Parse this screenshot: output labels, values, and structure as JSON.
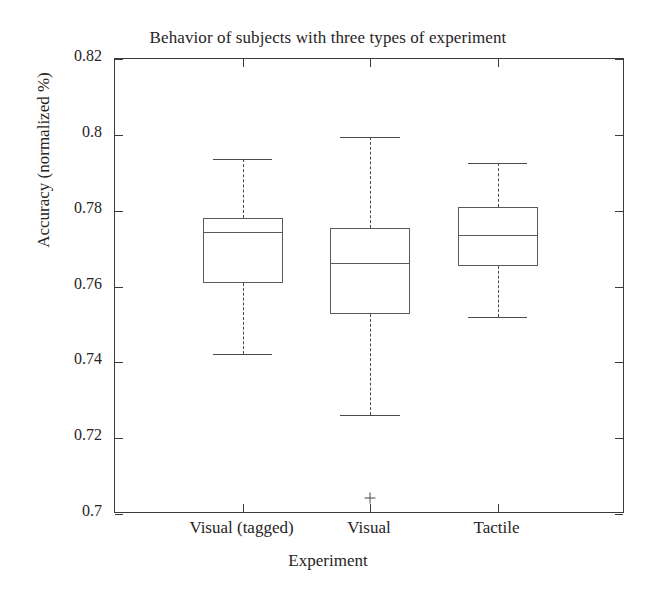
{
  "chart_data": {
    "type": "box",
    "title": "Behavior of subjects with three types of experiment",
    "xlabel": "Experiment",
    "ylabel": "Accuracy (normalized %)",
    "categories": [
      "Visual (tagged)",
      "Visual",
      "Tactile"
    ],
    "ylim": [
      0.7,
      0.82
    ],
    "yticks": [
      0.7,
      0.72,
      0.74,
      0.76,
      0.78,
      0.8,
      0.82
    ],
    "ytick_labels": [
      "0.7",
      "0.72",
      "0.74",
      "0.76",
      "0.78",
      "0.8",
      "0.82"
    ],
    "grid": false,
    "legend": "none",
    "box_color": "#5a5a5a",
    "whisker_color": "#4a4a4a",
    "frame_color": "#3a3a3a",
    "text_color": "#272425",
    "boxes": [
      {
        "category": "Visual (tagged)",
        "whisker_high": 0.7936,
        "q3": 0.778,
        "median": 0.7744,
        "q1": 0.7609,
        "whisker_low": 0.7422,
        "outliers": []
      },
      {
        "category": "Visual",
        "whisker_high": 0.7994,
        "q3": 0.7754,
        "median": 0.7662,
        "q1": 0.7527,
        "whisker_low": 0.7261,
        "outliers": [
          0.7042
        ]
      },
      {
        "category": "Tactile",
        "whisker_high": 0.7926,
        "q3": 0.781,
        "median": 0.7736,
        "q1": 0.7655,
        "whisker_low": 0.752,
        "outliers": []
      }
    ]
  }
}
